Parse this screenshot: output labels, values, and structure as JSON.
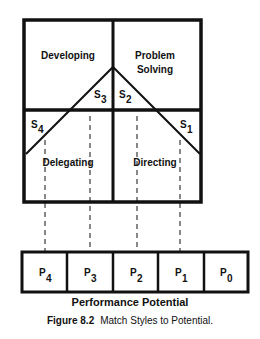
{
  "quadrants": {
    "top_left": "Developing",
    "top_right_line1": "Problem",
    "top_right_line2": "Solving",
    "bottom_left": "Delegating",
    "bottom_right": "Directing"
  },
  "styles": [
    {
      "label": "S",
      "sub": "1"
    },
    {
      "label": "S",
      "sub": "2"
    },
    {
      "label": "S",
      "sub": "3"
    },
    {
      "label": "S",
      "sub": "4"
    }
  ],
  "potential_boxes": [
    {
      "label": "P",
      "sub": "4"
    },
    {
      "label": "P",
      "sub": "3"
    },
    {
      "label": "P",
      "sub": "2"
    },
    {
      "label": "P",
      "sub": "1"
    },
    {
      "label": "P",
      "sub": "0"
    }
  ],
  "axis_title": "Performance Potential",
  "figure": {
    "number": "Figure 8.2",
    "caption": "Match Styles to Potential."
  }
}
